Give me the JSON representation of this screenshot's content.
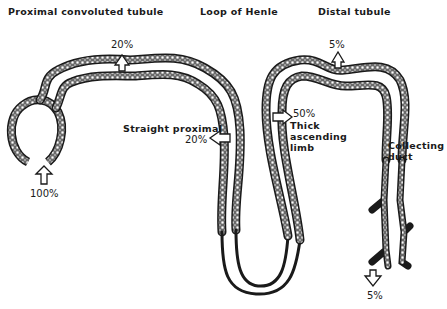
{
  "headers": {
    "proximal": "Proximal convoluted tubule",
    "loop": "Loop of Henle",
    "distal": "Distal tubule"
  },
  "labels": {
    "straight_proximal": "Straight proximal",
    "thick_ascending": [
      "Thick",
      "ascending",
      "limb"
    ],
    "collecting_duct": [
      "Collecting",
      "duct"
    ]
  },
  "percentages": {
    "glomerulus_input": "100%",
    "proximal_convoluted": "20%",
    "straight_proximal": "20%",
    "thick_ascending_limb": "50%",
    "distal_tubule": "5%",
    "collecting_duct_output": "5%"
  },
  "colors": {
    "ink": "#1a1a1a",
    "background": "#ffffff"
  }
}
